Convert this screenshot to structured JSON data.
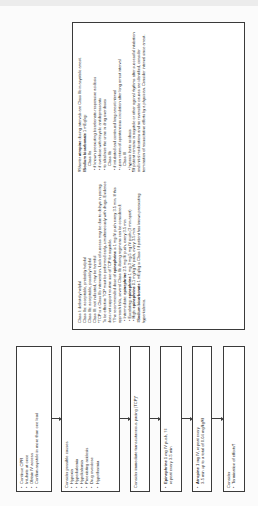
{
  "flowchart": {
    "box1": {
      "items": [
        "Continue CPR",
        "Intubate at once",
        "Obtain IV access",
        "Confirm asystole in more than one lead"
      ]
    },
    "box2": {
      "heading": "Consider possible causes",
      "items": [
        "Hypoxia",
        "Hyperkalemia",
        "Hypokalemia",
        "Preexisting acidosis",
        "Drug overdose",
        "Hypothermia"
      ]
    },
    "box3": {
      "text": "Consider immediate transcutaneous pacing (TCP)*"
    },
    "box4": {
      "drug": "Epinephrine",
      "text": " 1 mg IV push, †‡",
      "text2": "repeat every 3-5 min"
    },
    "box5": {
      "drug": "Atropine",
      "text": " 1 mg IV, repeat every",
      "text2": "3-5 min up to a total of 0.04 mg/kg§‖"
    },
    "box6": {
      "heading": "Consider",
      "item": "Termination of efforts¶"
    }
  },
  "notes": {
    "left": {
      "class_defs": [
        "Class I: definitely helpful",
        "Class IIa: acceptable, probably helpful",
        "Class IIb: acceptable, possibly helpful",
        "Class III: not indicated, may be harmful"
      ],
      "tcp_note": "*TCP is a Class IIb intervention. Lack of success may be due to delays in pacing. To be effective TCP must be performed early, simultaneously with drugs. Evidence does not support routine use of TCP for asystole.",
      "epi_intro_pre": "†The recommended dose of ",
      "epi_intro_drug": "epinephrine",
      "epi_intro_post": " is 1 mg IV push every 3-5 min. If this approach fails, several Class IIb dosing regimens can be considered:",
      "regimens": [
        {
          "label": "Intermediate: ",
          "drug": "epinephrine",
          "rest": " 2-5 mg IV push, every 3-5 min"
        },
        {
          "label": "Escalating: ",
          "drug": "epinephrine",
          "rest": " 1 mg-3 mg-5 mg IV push (3 min apart)"
        },
        {
          "label": "High: ",
          "drug": "epinephrine",
          "rest": " 0.1 mg/kg IV push, every 3-5 min"
        }
      ],
      "bicarb_pre": "‡",
      "bicarb_drug": "Sodium bicarbonate",
      "bicarb_post": " 1 mEq/kg is Class I if patient has known preexisting hyperkalemia."
    },
    "right": {
      "atropine_pre": "§Shorter ",
      "atropine_drug": "atropine",
      "atropine_post": " dosing intervals are Class IIb in asystolic arrest.",
      "bicarb_pre": "‖",
      "bicarb_drug": "Sodium bicarbonate",
      "bicarb_post": " 1 mEq/kg:",
      "class_iia": "Class IIa",
      "iia_items": [
        "if known preexisting bicarbonate-responsive acidosis",
        "if overdose with tricyclic antidepressants",
        "to alkalinize the urine in drug overdoses"
      ],
      "class_iib": "Class IIb",
      "iib_items": [
        "if intubated and continued long arrest interval",
        "upon return of spontaneous circulation after long arrest interval"
      ],
      "class_iii": "Class III",
      "iii_items": [
        "hypoxic lactic acidosis"
      ],
      "termination": "¶If patient remains in asystole or other agonal rhythms after successful intubation and initial medications and no reversible causes are identified, consider termination of resuscitative efforts by a physician. Consider interval since arrest."
    }
  }
}
